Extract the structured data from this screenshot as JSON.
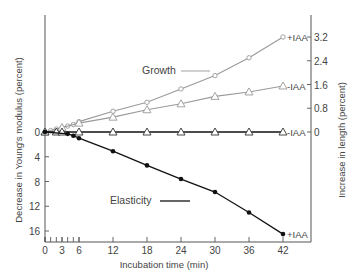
{
  "chart_data": {
    "type": "line",
    "title": "",
    "xlabel": "Incubation time (min)",
    "ylabel_left": "Decrease in Young's modulus (percent)",
    "ylabel_right": "Increase in length (percent)",
    "x_ticks": [
      0,
      3,
      6,
      12,
      18,
      24,
      30,
      36,
      42
    ],
    "x_tick_labels": [
      "0",
      "3",
      "6",
      "12",
      "18",
      "24",
      "30",
      "36",
      "42"
    ],
    "x_minor_ticks": [
      0,
      1,
      2,
      3,
      4,
      5,
      6
    ],
    "xlim": [
      0,
      47
    ],
    "y_left_ticks": [
      0,
      4,
      8,
      12,
      16
    ],
    "y_left_tick_labels": [
      "0",
      "4",
      "8",
      "12",
      "16"
    ],
    "y_left_lim": [
      0,
      17.5
    ],
    "y_left_inverted": true,
    "y_right_ticks": [
      0,
      0.8,
      1.6,
      2.4,
      3.2
    ],
    "y_right_tick_labels": [
      "0",
      "0.8",
      "1.6",
      "2.4",
      "3.2"
    ],
    "y_right_lim": [
      0,
      3.6
    ],
    "grid": false,
    "legend": [
      {
        "label": "Growth",
        "style": "gray line",
        "position": "upper-center"
      },
      {
        "label": "Elasticity",
        "style": "black line",
        "position": "lower-center"
      }
    ],
    "series": [
      {
        "name": "Growth +IAA",
        "axis": "right",
        "marker": "circle",
        "color": "#9a9a9a",
        "end_label": "+IAA",
        "x": [
          0,
          1,
          2,
          3,
          4,
          5,
          6,
          12,
          18,
          24,
          30,
          36,
          42
        ],
        "values": [
          0,
          0.05,
          0.1,
          0.15,
          0.2,
          0.25,
          0.35,
          0.7,
          1.0,
          1.45,
          1.9,
          2.5,
          3.2
        ]
      },
      {
        "name": "Growth -IAA",
        "axis": "right",
        "marker": "triangle",
        "color": "#9a9a9a",
        "end_label": "-IAA",
        "x": [
          0,
          3,
          6,
          12,
          18,
          24,
          30,
          36,
          42
        ],
        "values": [
          0,
          0.15,
          0.3,
          0.5,
          0.75,
          0.95,
          1.2,
          1.35,
          1.55
        ]
      },
      {
        "name": "Elasticity -IAA",
        "axis": "left",
        "marker": "triangle",
        "color": "#111111",
        "end_label": "-IAA",
        "x": [
          0,
          2,
          3,
          6,
          12,
          18,
          24,
          30,
          36,
          42
        ],
        "values": [
          0,
          0,
          0,
          0,
          0,
          0,
          0,
          0,
          0,
          0
        ]
      },
      {
        "name": "Elasticity +IAA",
        "axis": "left",
        "marker": "filled-circle",
        "color": "#111111",
        "end_label": "+IAA",
        "x": [
          0,
          4,
          5,
          6,
          12,
          18,
          24,
          30,
          36,
          42
        ],
        "values": [
          0,
          0.3,
          0.6,
          1.0,
          3.1,
          5.4,
          7.6,
          9.7,
          13.0,
          16.5
        ]
      }
    ]
  },
  "labels": {
    "growth_legend": "Growth",
    "elasticity_legend": "Elasticity",
    "xlabel": "Incubation time (min)",
    "ylabel_left": "Decrease in Young's modulus (percent)",
    "ylabel_right": "Increase in length (percent)",
    "end_plus_growth": "+IAA",
    "end_minus_growth": "-IAA",
    "end_minus_flat": "-IAA",
    "end_plus_elasticity": "+IAA"
  }
}
